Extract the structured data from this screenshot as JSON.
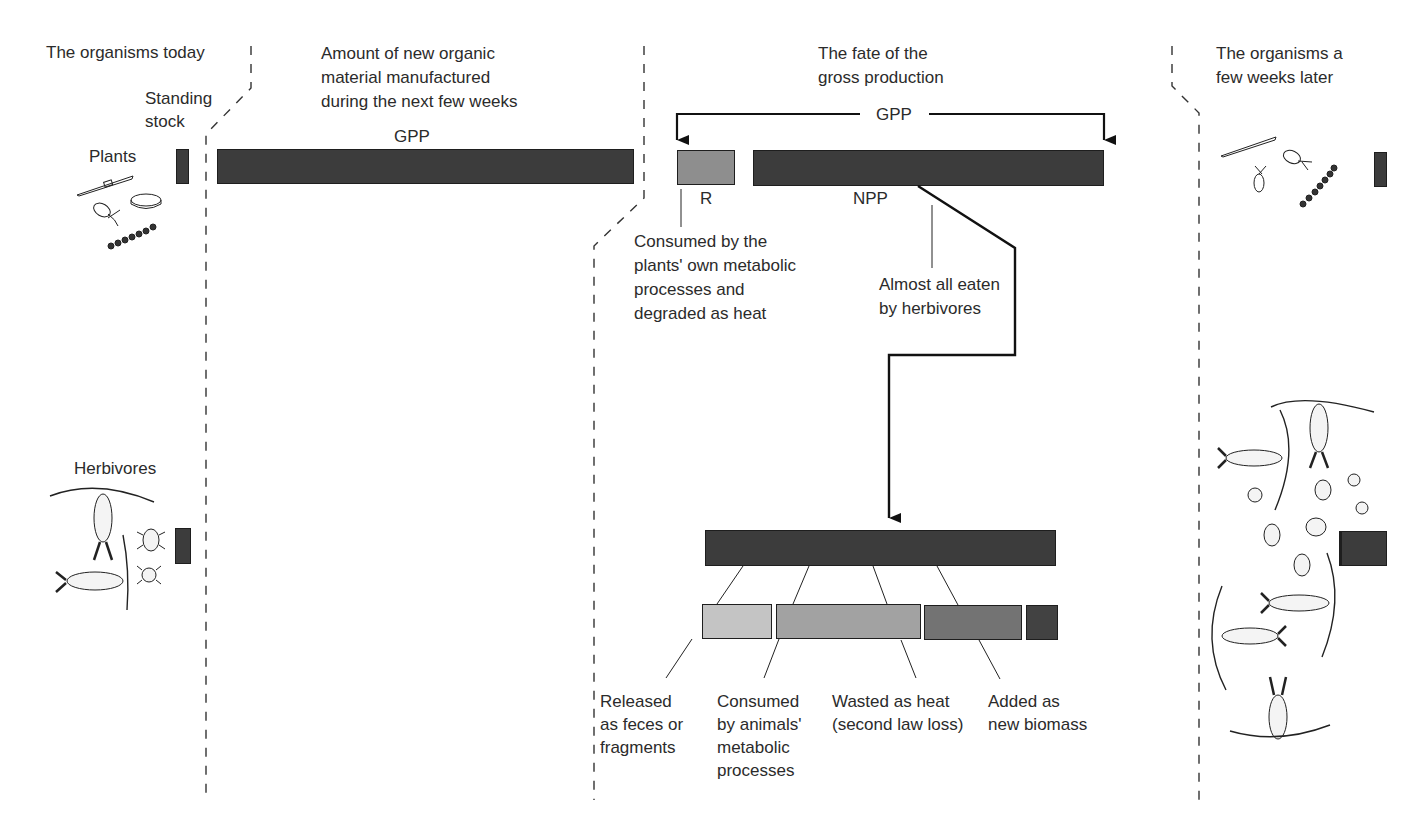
{
  "columns": {
    "today": {
      "header": "The organisms today",
      "standing_stock": "Standing\nstock"
    },
    "production": {
      "header": "Amount of new organic\nmaterial manufactured\nduring the next few weeks",
      "gpp_label": "GPP"
    },
    "fate": {
      "header": "The fate of the\ngross production",
      "gpp_bracket_label": "GPP",
      "r_label": "R",
      "npp_label": "NPP",
      "r_note": "Consumed by the\nplants' own metabolic\nprocesses and\ndegraded as heat",
      "npp_note": "Almost all eaten\nby herbivores",
      "herbivore_outcomes": [
        {
          "label": "Released\nas feces or\nfragments",
          "shade": "#c4c4c4"
        },
        {
          "label": "Consumed\nby animals'\nmetabolic\nprocesses",
          "shade": "#a2a2a2"
        },
        {
          "label": "Wasted as heat\n(second law loss)",
          "shade": "#737373"
        },
        {
          "label": "Added as\nnew biomass",
          "shade": "#424242"
        }
      ]
    },
    "later": {
      "header": "The organisms a\nfew weeks later"
    }
  },
  "rows": {
    "plants": {
      "label": "Plants"
    },
    "herbivores": {
      "label": "Herbivores"
    }
  },
  "colors": {
    "dark_bar": "#3c3c3c",
    "r_bar": "#8e8e8e",
    "line": "#111111",
    "dashed": "#333333"
  }
}
